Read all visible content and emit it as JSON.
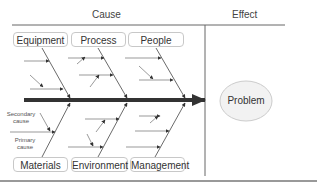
{
  "diagram": {
    "type": "fishbone",
    "columns": {
      "cause_label": "Cause",
      "effect_label": "Effect"
    },
    "top_categories": [
      {
        "label": "Equipment"
      },
      {
        "label": "Process"
      },
      {
        "label": "People"
      }
    ],
    "bottom_categories": [
      {
        "label": "Materials"
      },
      {
        "label": "Environment"
      },
      {
        "label": "Management"
      }
    ],
    "annotations": {
      "secondary_cause": "Secondary cause",
      "primary_cause": "Primary cause"
    },
    "effect": {
      "label": "Problem"
    },
    "colors": {
      "spine": "#333333",
      "bone": "#444444",
      "box_border": "#c8c8c8",
      "ellipse_fill": "#f2f2f2",
      "ellipse_border": "#cccccc",
      "rule": "#888888"
    }
  }
}
